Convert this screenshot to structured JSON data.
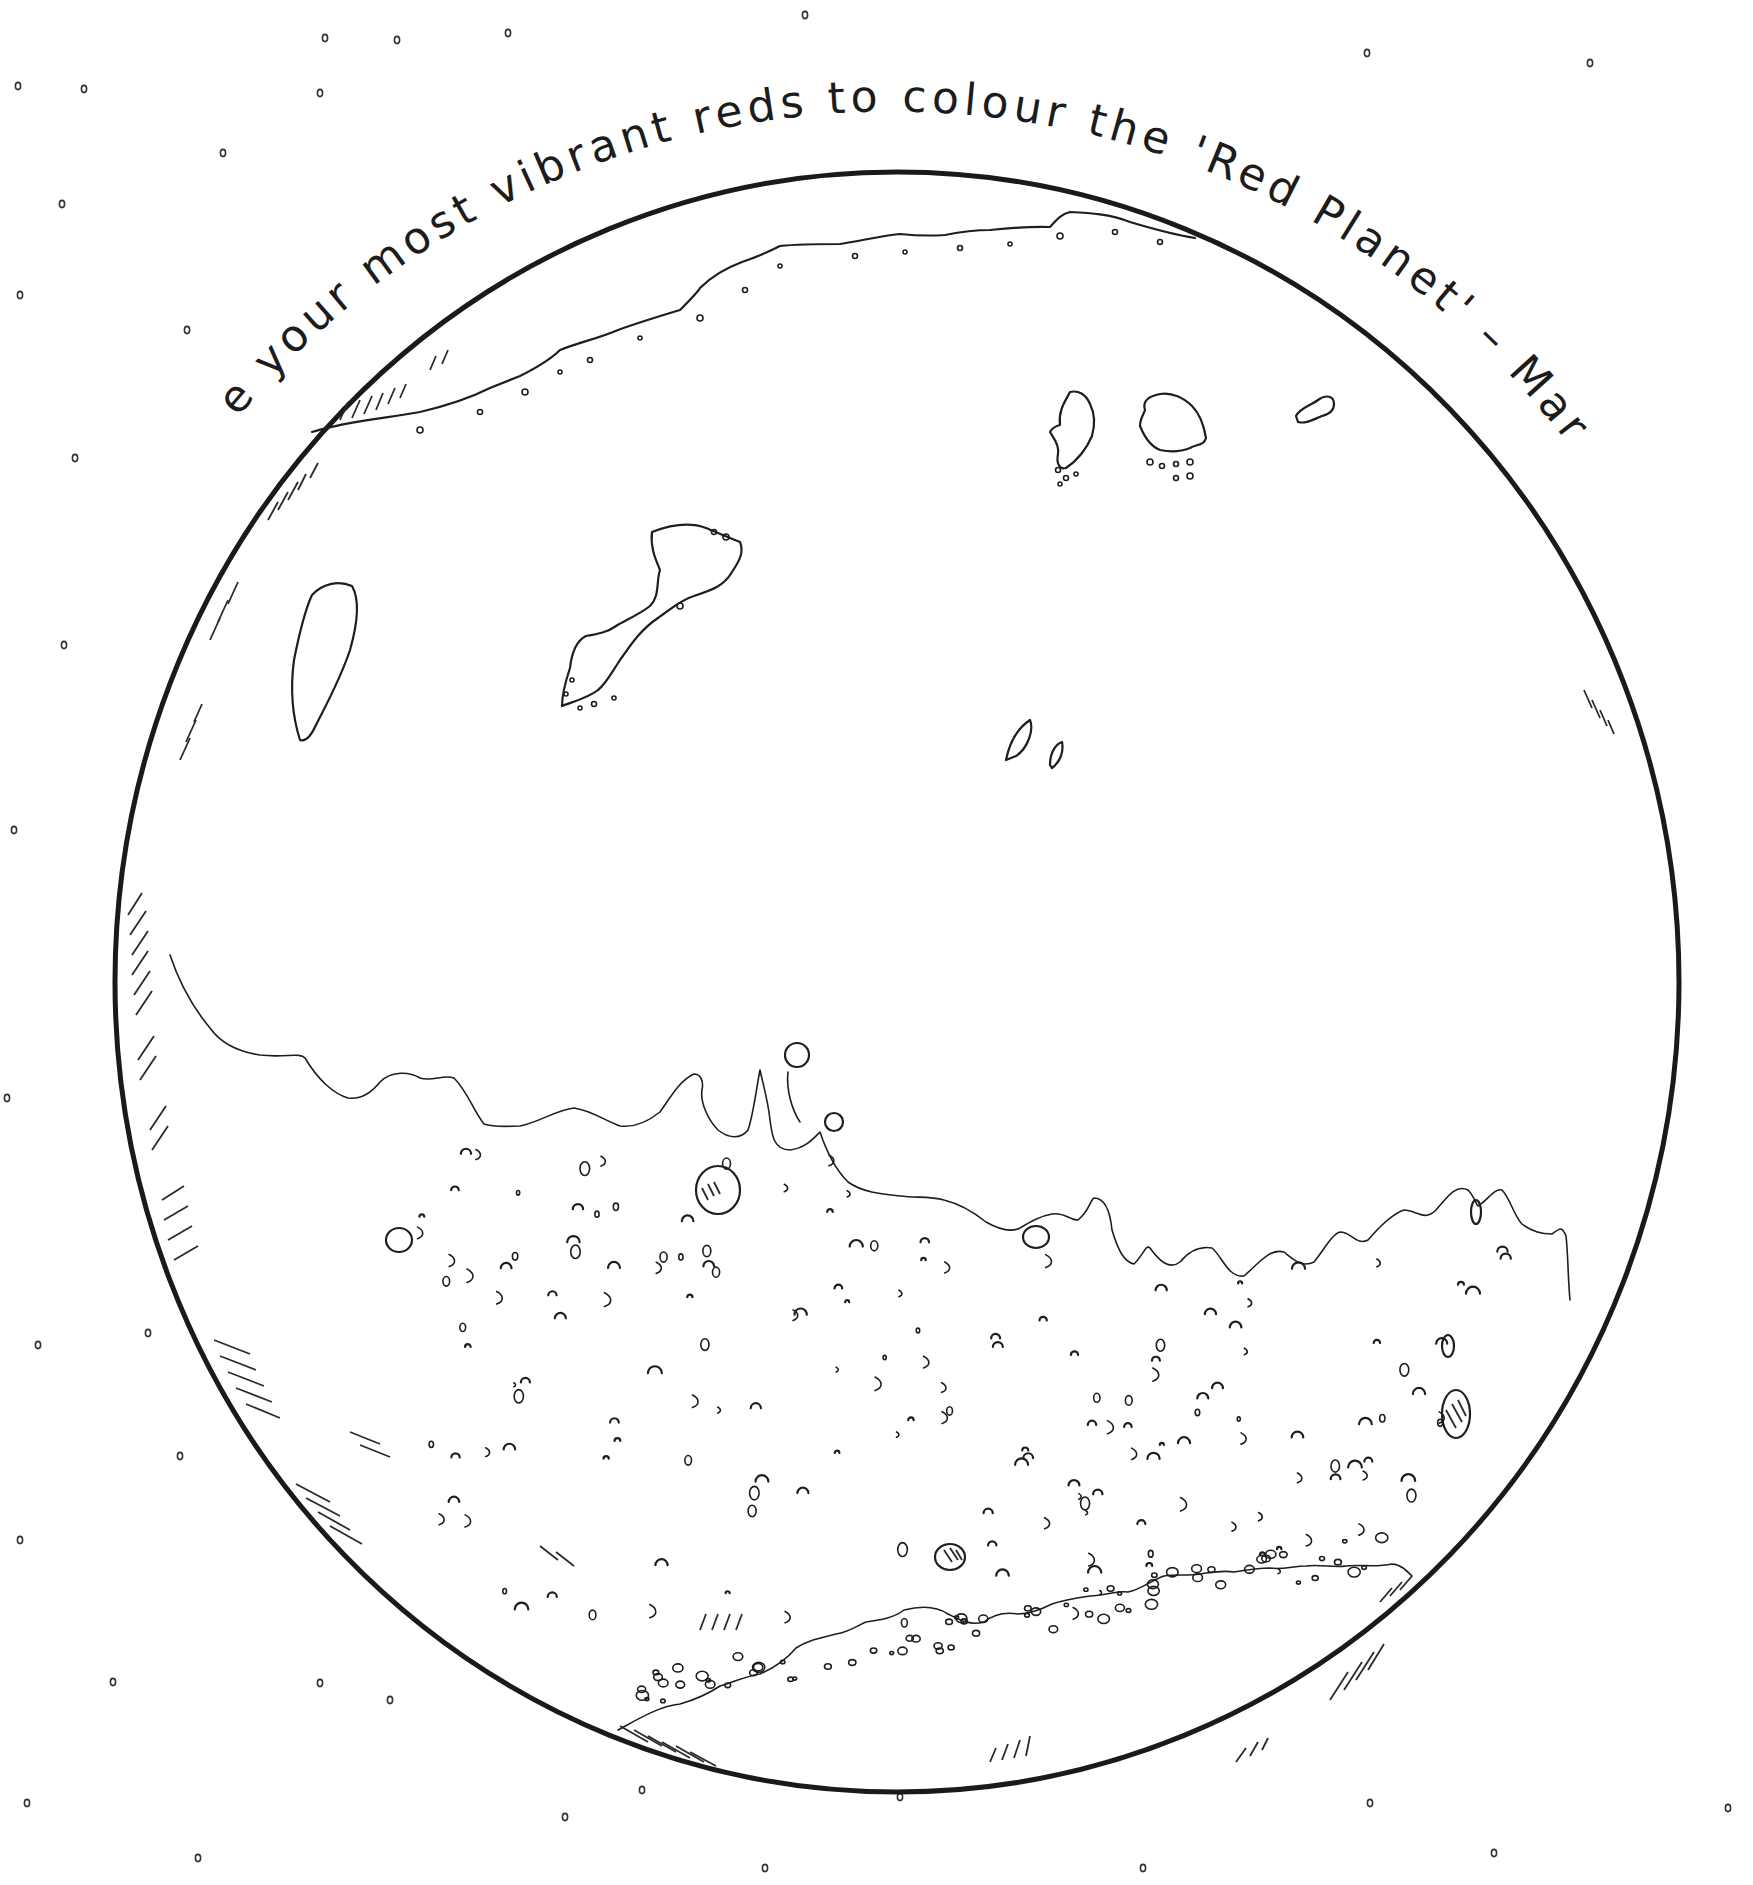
{
  "page": {
    "caption": "Use your most vibrant reds to colour the 'Red Planet' – Mars.",
    "subject": "Mars",
    "style": "colouring page line art",
    "colors": {
      "background": "#ffffff",
      "ink": "#1e1e1e"
    }
  },
  "illustration": {
    "planet": {
      "cx": 897,
      "cy": 982,
      "rx": 782,
      "ry": 810
    },
    "stars": [
      [
        325,
        38
      ],
      [
        397,
        40
      ],
      [
        508,
        33
      ],
      [
        805,
        15
      ],
      [
        1367,
        53
      ],
      [
        1590,
        63
      ],
      [
        18,
        86
      ],
      [
        84,
        89
      ],
      [
        320,
        93
      ],
      [
        223,
        153
      ],
      [
        62,
        204
      ],
      [
        20,
        295
      ],
      [
        187,
        330
      ],
      [
        75,
        458
      ],
      [
        64,
        645
      ],
      [
        14,
        830
      ],
      [
        7,
        1098
      ],
      [
        148,
        1333
      ],
      [
        38,
        1345
      ],
      [
        180,
        1456
      ],
      [
        20,
        1540
      ],
      [
        113,
        1682
      ],
      [
        320,
        1683
      ],
      [
        390,
        1700
      ],
      [
        27,
        1803
      ],
      [
        565,
        1817
      ],
      [
        642,
        1790
      ],
      [
        900,
        1797
      ],
      [
        1370,
        1803
      ],
      [
        1728,
        1808
      ],
      [
        765,
        1868
      ],
      [
        1143,
        1868
      ],
      [
        1494,
        1853
      ],
      [
        198,
        1858
      ]
    ]
  }
}
